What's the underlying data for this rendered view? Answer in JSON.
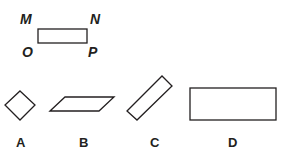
{
  "reference": {
    "vertex_labels": [
      "M",
      "N",
      "O",
      "P"
    ]
  },
  "options": [
    {
      "label": "A",
      "shape": "diamond"
    },
    {
      "label": "B",
      "shape": "parallelogram"
    },
    {
      "label": "C",
      "shape": "rotated-rectangle"
    },
    {
      "label": "D",
      "shape": "rectangle"
    }
  ],
  "colors": {
    "stroke": "#231f20",
    "background": "#ffffff"
  }
}
